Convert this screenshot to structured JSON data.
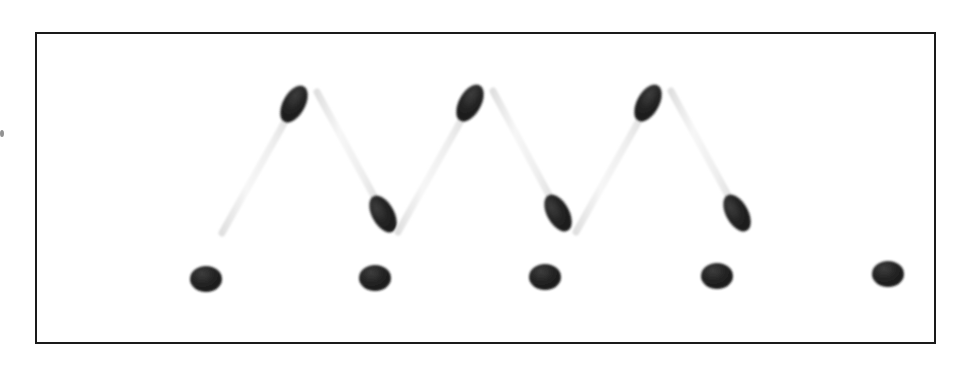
{
  "scene": {
    "title": "Matchsticks arrangement",
    "description": "Five matchsticks arranged in a zigzag W pattern above five matchsticks laid end-to-end in a horizontal row, inside a thin black rectangular frame.",
    "background_color": "#ffffff",
    "frame": {
      "border_color": "#1a1a1a",
      "border_width_px": 2,
      "x": 35,
      "y": 32,
      "width": 901,
      "height": 312
    },
    "colors": {
      "match_head": "#1c1c1c",
      "match_head_highlight": "#3a3a3a",
      "stick_diagonal": "#f1f1f1",
      "stick_diagonal_edge": "#dcdcdc",
      "stick_horizontal": "#ebebeb",
      "stick_horizontal_edge": "#d8d8d8",
      "speck": "#6d6d6d"
    },
    "counts": {
      "zigzag_matches": 5,
      "row_matches": 5,
      "total_matches": 10
    }
  },
  "zigzag_matches": [
    {
      "id": "zigzag-match-1",
      "direction": "up-right",
      "tail": {
        "x": 222,
        "y": 233
      },
      "head": {
        "x": 294,
        "y": 104
      },
      "head_angle_deg": -61,
      "head_rx": 11,
      "head_ry": 20,
      "stick_width": 7
    },
    {
      "id": "zigzag-match-2",
      "direction": "down-right",
      "tail": {
        "x": 317,
        "y": 92
      },
      "head": {
        "x": 383,
        "y": 214
      },
      "head_angle_deg": -61,
      "head_rx": 11,
      "head_ry": 20,
      "stick_width": 7
    },
    {
      "id": "zigzag-match-3",
      "direction": "up-right",
      "tail": {
        "x": 398,
        "y": 232
      },
      "head": {
        "x": 470,
        "y": 103
      },
      "head_angle_deg": -61,
      "head_rx": 11,
      "head_ry": 20,
      "stick_width": 7
    },
    {
      "id": "zigzag-match-4",
      "direction": "down-right",
      "tail": {
        "x": 493,
        "y": 91
      },
      "head": {
        "x": 558,
        "y": 213
      },
      "head_angle_deg": -61,
      "head_rx": 11,
      "head_ry": 20,
      "stick_width": 7
    },
    {
      "id": "zigzag-match-5",
      "direction": "up-right",
      "tail": {
        "x": 576,
        "y": 232
      },
      "head": {
        "x": 648,
        "y": 103
      },
      "head_angle_deg": -61,
      "head_rx": 11,
      "head_ry": 20,
      "stick_width": 7
    },
    {
      "id": "zigzag-match-6",
      "direction": "down-right",
      "tail": {
        "x": 671,
        "y": 91
      },
      "head": {
        "x": 737,
        "y": 213
      },
      "head_angle_deg": -61,
      "head_rx": 11,
      "head_ry": 20,
      "stick_width": 7
    }
  ],
  "row_matches": [
    {
      "id": "row-match-1",
      "stick_x1": 68,
      "stick_x2": 198,
      "y": 279,
      "head": {
        "x": 206,
        "y": 279
      },
      "head_rx": 16,
      "head_ry": 13,
      "stick_width": 9
    },
    {
      "id": "row-match-2",
      "stick_x1": 238,
      "stick_x2": 367,
      "y": 278,
      "head": {
        "x": 375,
        "y": 278
      },
      "head_rx": 16,
      "head_ry": 13,
      "stick_width": 9
    },
    {
      "id": "row-match-3",
      "stick_x1": 408,
      "stick_x2": 537,
      "y": 277,
      "head": {
        "x": 545,
        "y": 277
      },
      "head_rx": 16,
      "head_ry": 13,
      "stick_width": 9
    },
    {
      "id": "row-match-4",
      "stick_x1": 578,
      "stick_x2": 709,
      "y": 276,
      "head": {
        "x": 717,
        "y": 276
      },
      "head_rx": 16,
      "head_ry": 13,
      "stick_width": 9
    },
    {
      "id": "row-match-5",
      "stick_x1": 750,
      "stick_x2": 880,
      "y": 274,
      "head": {
        "x": 888,
        "y": 274
      },
      "head_rx": 16,
      "head_ry": 13,
      "stick_width": 9
    }
  ],
  "speck": {
    "id": "edge-speck",
    "x": 0,
    "y": 130,
    "width": 4,
    "height": 7
  }
}
